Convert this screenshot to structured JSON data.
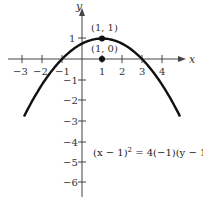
{
  "chart_data": {
    "type": "line",
    "title": "",
    "xlabel": "x",
    "ylabel": "y",
    "xlim": [
      -3.2,
      5
    ],
    "ylim": [
      -6.5,
      2
    ],
    "x_ticks": [
      "-3",
      "-2",
      "-1",
      "1",
      "2",
      "3",
      "4"
    ],
    "y_ticks": [
      "1",
      "-1",
      "-2",
      "-3",
      "-4",
      "-5",
      "-6"
    ],
    "series": [
      {
        "name": "parabola",
        "equation": "(x - 1)^2 = 4(-1)(y - 1)",
        "x": [
          -2.9,
          -2,
          -1,
          0,
          1,
          2,
          3,
          4,
          4.9
        ],
        "y": [
          -2.8,
          -1.25,
          0,
          0.75,
          1,
          0.75,
          0,
          -1.25,
          -2.8
        ]
      }
    ],
    "points": [
      {
        "label": "(1, 1)",
        "x": 1,
        "y": 1,
        "role": "vertex"
      },
      {
        "label": "(1, 0)",
        "x": 1,
        "y": 0,
        "role": "focus"
      }
    ],
    "annotations": [
      "(x − 1)² = 4(−1)(y − 1)"
    ],
    "grid": false,
    "legend": "none"
  },
  "labels": {
    "x_axis": "x",
    "y_axis": "y",
    "vertex": "(1, 1)",
    "focus": "(1, 0)",
    "eq_lhs": "(x − 1)",
    "eq_sup": "2",
    "eq_rhs": " = 4(−1)(y − 1)",
    "xt_m3": "−3",
    "xt_m2": "−2",
    "xt_m1": "−1",
    "xt_1": "1",
    "xt_2": "2",
    "xt_3": "3",
    "xt_4": "4",
    "yt_1": "1",
    "yt_m1": "−1",
    "yt_m2": "−2",
    "yt_m3": "−3",
    "yt_m4": "−4",
    "yt_m5": "−5",
    "yt_m6": "−6"
  }
}
